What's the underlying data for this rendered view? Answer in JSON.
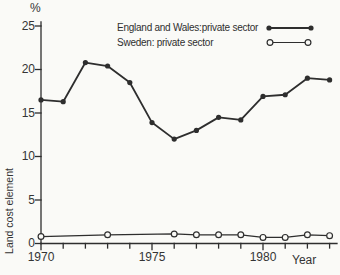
{
  "chart_data": {
    "type": "line",
    "title": "",
    "ylabel": "Land cost element",
    "y_unit_label": "%",
    "xlabel": "Year",
    "xlim": [
      1970,
      1983.4
    ],
    "ylim": [
      0,
      25
    ],
    "grid": false,
    "legend_position": "top-right",
    "background": "#fafaf7",
    "line_color": "#2e2e2e",
    "y_ticks": [
      0,
      5,
      10,
      15,
      20,
      25
    ],
    "x_tick_labels": [
      "1970",
      "1975",
      "1980"
    ],
    "x_minor_ticks": [
      1970,
      1971,
      1972,
      1973,
      1974,
      1975,
      1976,
      1977,
      1978,
      1979,
      1980,
      1981,
      1982,
      1983
    ],
    "series": [
      {
        "name": "England and Wales:private sector",
        "marker": "filled-circle",
        "x": [
          1970,
          1971,
          1972,
          1973,
          1974,
          1975,
          1976,
          1977,
          1978,
          1979,
          1980,
          1981,
          1982,
          1983
        ],
        "values": [
          16.5,
          16.3,
          20.8,
          20.4,
          18.5,
          13.9,
          12.0,
          13.0,
          14.5,
          14.2,
          16.9,
          17.1,
          19.0,
          18.8
        ]
      },
      {
        "name": "Sweden: private sector",
        "marker": "open-circle",
        "x": [
          1970,
          1973,
          1976,
          1977,
          1978,
          1979,
          1980,
          1981,
          1982,
          1983
        ],
        "values": [
          0.8,
          1.0,
          1.1,
          1.0,
          1.0,
          1.0,
          0.7,
          0.7,
          1.0,
          0.9
        ]
      }
    ]
  }
}
